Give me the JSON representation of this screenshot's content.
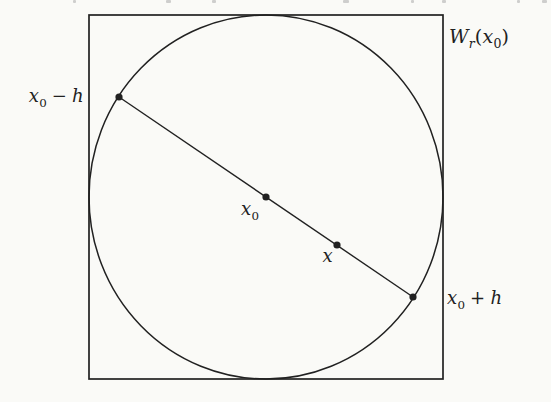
{
  "colors": {
    "ink": "#212121",
    "paper": "#fafaf7"
  },
  "figure": {
    "labels": {
      "x0_minus_h": {
        "var1": "x",
        "sub1": "0",
        "op": "−",
        "var2": "h"
      },
      "center": {
        "var": "x",
        "sub": "0"
      },
      "point_x": {
        "var": "x"
      },
      "x0_plus_h": {
        "var1": "x",
        "sub1": "0",
        "op": "+",
        "var2": "h"
      },
      "window": {
        "func": "W",
        "func_sub": "r",
        "open_paren": "(",
        "var": "x",
        "var_sub": "0",
        "close_paren": ")"
      }
    }
  }
}
